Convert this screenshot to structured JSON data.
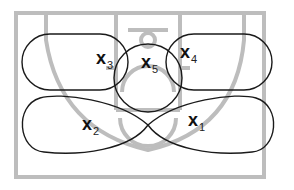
{
  "diagram": {
    "type": "basketball-zone-defense",
    "colors": {
      "court_lines": "#bdbdbd",
      "zone_outlines": "#1a1a1a",
      "labels": "#111111",
      "background": "#ffffff"
    },
    "players": [
      {
        "id": "x1",
        "letter": "x",
        "number": "1",
        "zone": "lower-right"
      },
      {
        "id": "x2",
        "letter": "x",
        "number": "2",
        "zone": "lower-left"
      },
      {
        "id": "x3",
        "letter": "x",
        "number": "3",
        "zone": "upper-left"
      },
      {
        "id": "x4",
        "letter": "x",
        "number": "4",
        "zone": "upper-right"
      },
      {
        "id": "x5",
        "letter": "x",
        "number": "5",
        "zone": "top-center"
      }
    ]
  }
}
